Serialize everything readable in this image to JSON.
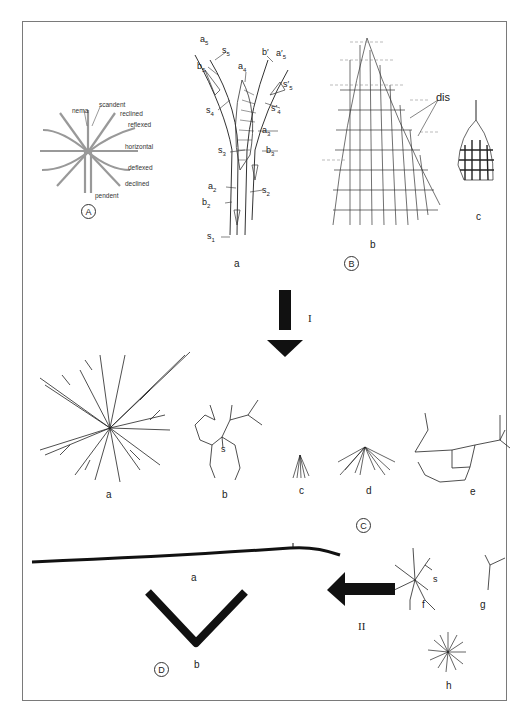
{
  "figure": {
    "panels": [
      {
        "id": "A",
        "circle_label": "A",
        "description": "Rhabdosome orientation terms",
        "terms": [
          "nema",
          "scandent",
          "reclined",
          "reflexed",
          "horizontal",
          "deflexed",
          "declined",
          "pendent"
        ]
      },
      {
        "id": "B",
        "circle_label": "B",
        "subfigures": [
          {
            "label": "a",
            "annotations": [
              "a5",
              "s5",
              "b5",
              "a4",
              "b'",
              "a'5",
              "s'5",
              "s4",
              "s'4",
              "a3",
              "s3",
              "b3",
              "a2",
              "s2",
              "b2",
              "s1"
            ]
          },
          {
            "label": "b",
            "annotations": [
              "dis"
            ]
          },
          {
            "label": "c",
            "annotations": []
          }
        ]
      },
      {
        "id": "C",
        "circle_label": "C",
        "subfigures": [
          {
            "label": "a"
          },
          {
            "label": "b",
            "annotations": [
              "s"
            ]
          },
          {
            "label": "c"
          },
          {
            "label": "d"
          },
          {
            "label": "e"
          },
          {
            "label": "f",
            "annotations": [
              "s"
            ]
          },
          {
            "label": "g"
          },
          {
            "label": "h"
          }
        ]
      },
      {
        "id": "D",
        "circle_label": "D",
        "subfigures": [
          {
            "label": "a"
          },
          {
            "label": "b"
          }
        ]
      }
    ],
    "arrows": [
      {
        "label": "I",
        "direction": "down",
        "from": "B",
        "to": "C"
      },
      {
        "label": "II",
        "direction": "left",
        "from": "C",
        "to": "D"
      }
    ]
  },
  "labels": {
    "A": {
      "circle": "A",
      "nema": "nema",
      "scandent": "scandent",
      "reclined": "reclined",
      "reflexed": "reflexed",
      "horizontal": "horizontal",
      "deflexed": "deflexed",
      "declined": "declined",
      "pendent": "pendent"
    },
    "B": {
      "circle": "B",
      "a": "a",
      "b": "b",
      "c": "c",
      "dis": "dis",
      "a5": "a",
      "a5s": "5",
      "s5": "s",
      "s5s": "5",
      "b5": "b",
      "b5s": "5",
      "a4": "a",
      "a4s": "4",
      "bp": "b′",
      "ap5": "a′",
      "ap5s": "5",
      "sp5": "s′",
      "sp5s": "5",
      "s4": "s",
      "s4s": "4",
      "sp4": "s′",
      "sp4s": "4",
      "a3": "a",
      "a3s": "3",
      "s3": "s",
      "s3s": "3",
      "b3": "b",
      "b3s": "3",
      "a2": "a",
      "a2s": "2",
      "s2": "s",
      "s2s": "2",
      "b2": "b",
      "b2s": "2",
      "s1": "s",
      "s1s": "1"
    },
    "C": {
      "circle": "C",
      "a": "a",
      "b": "b",
      "c": "c",
      "d": "d",
      "e": "e",
      "f": "f",
      "g": "g",
      "h": "h",
      "s_b": "s",
      "s_f": "s"
    },
    "D": {
      "circle": "D",
      "a": "a",
      "b": "b"
    },
    "arrow_I": "I",
    "arrow_II": "II"
  },
  "colors": {
    "ink": "#111111",
    "frame": "#7a7a7a",
    "background": "#ffffff"
  }
}
